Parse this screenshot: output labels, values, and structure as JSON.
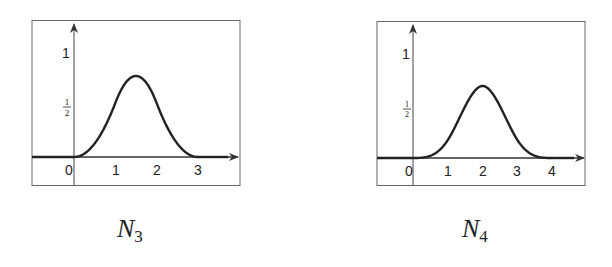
{
  "chart_data": [
    {
      "type": "line",
      "title": "N_3",
      "caption": "N",
      "caption_sub": "3",
      "description": "Quadratic B-spline (degree 2) supported on [0,3]",
      "xlabel": "",
      "ylabel": "",
      "x_ticks": [
        "0",
        "1",
        "2",
        "3"
      ],
      "y_ticks": [
        "1/2",
        "1"
      ],
      "xlim": [
        -1,
        3.9
      ],
      "ylim": [
        -0.27,
        1.3
      ],
      "grid": false,
      "series": [
        {
          "name": "N3",
          "x": [
            0,
            0.25,
            0.5,
            0.75,
            1.0,
            1.25,
            1.5,
            1.75,
            2.0,
            2.25,
            2.5,
            2.75,
            3.0
          ],
          "values": [
            0,
            0.03125,
            0.125,
            0.28125,
            0.5,
            0.6875,
            0.75,
            0.6875,
            0.5,
            0.28125,
            0.125,
            0.03125,
            0
          ]
        }
      ],
      "peak": {
        "x": 1.5,
        "y": 0.75
      }
    },
    {
      "type": "line",
      "title": "N_4",
      "caption": "N",
      "caption_sub": "4",
      "description": "Cubic B-spline (degree 3) supported on [0,4]",
      "xlabel": "",
      "ylabel": "",
      "x_ticks": [
        "0",
        "1",
        "2",
        "3",
        "4"
      ],
      "y_ticks": [
        "1/2",
        "1"
      ],
      "xlim": [
        -1,
        4.9
      ],
      "ylim": [
        -0.27,
        1.3
      ],
      "grid": false,
      "series": [
        {
          "name": "N4",
          "x": [
            0,
            0.5,
            1.0,
            1.5,
            2.0,
            2.5,
            3.0,
            3.5,
            4.0
          ],
          "values": [
            0,
            0.0208,
            0.1667,
            0.4792,
            0.6667,
            0.4792,
            0.1667,
            0.0208,
            0
          ]
        }
      ],
      "peak": {
        "x": 2,
        "y": 0.6667
      }
    }
  ],
  "labels": {
    "left": {
      "one": "1",
      "half_num": "1",
      "half_den": "2",
      "ticks": [
        "0",
        "1",
        "2",
        "3"
      ]
    },
    "right": {
      "one": "1",
      "half_num": "1",
      "half_den": "2",
      "ticks": [
        "0",
        "1",
        "2",
        "3",
        "4"
      ]
    }
  },
  "colors": {
    "axis": "#333333",
    "curve": "#222222",
    "frame": "#555555"
  }
}
